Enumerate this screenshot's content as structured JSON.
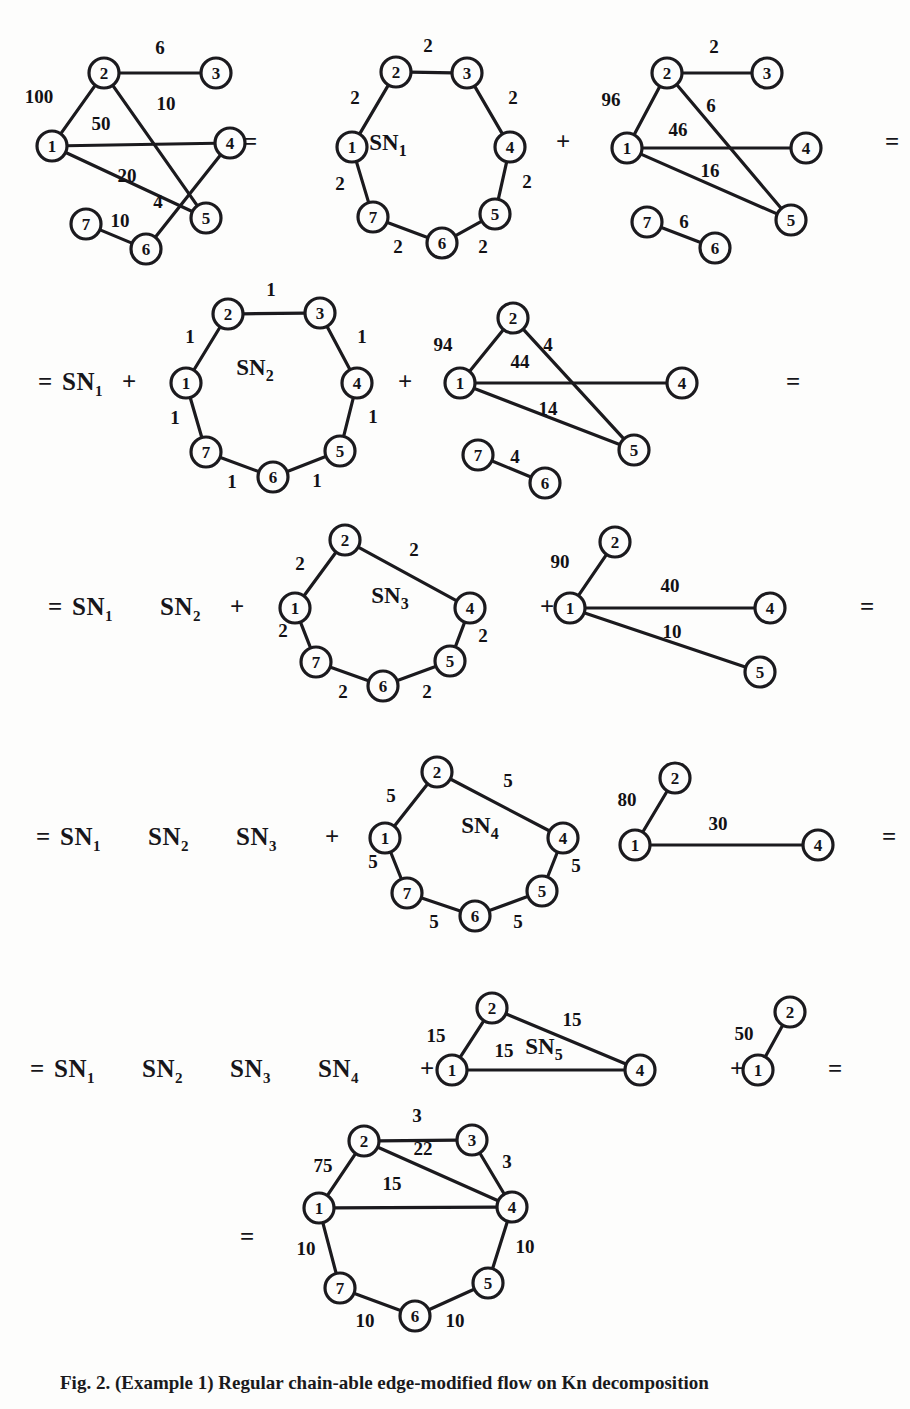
{
  "figure": {
    "caption": "Fig. 2. (Example 1) Regular chain-able edge-modified flow on Kn decomposition",
    "node_radius": 15,
    "colors": {
      "ink": "#17161a",
      "paper": "#fdfdfc",
      "edge": "#1b1a1e"
    }
  },
  "operators": [
    {
      "name": "eq-row1-a",
      "text": "=",
      "x": 243,
      "y": 143
    },
    {
      "name": "plus-row1-a",
      "text": "+",
      "x": 556,
      "y": 143
    },
    {
      "name": "eq-row1-b",
      "text": "=",
      "x": 885,
      "y": 143
    },
    {
      "name": "eq-row2",
      "text": "=",
      "x": 38,
      "y": 383
    },
    {
      "name": "sn1-row2",
      "text": "SN",
      "x": 62,
      "y": 383,
      "sub": "1"
    },
    {
      "name": "plus-row2-a",
      "text": "+",
      "x": 122,
      "y": 383
    },
    {
      "name": "plus-row2-b",
      "text": "+",
      "x": 398,
      "y": 383
    },
    {
      "name": "eq-row2-b",
      "text": "=",
      "x": 786,
      "y": 383
    },
    {
      "name": "eq-row3",
      "text": "=",
      "x": 48,
      "y": 608
    },
    {
      "name": "plus-row3-a",
      "text": "+",
      "x": 230,
      "y": 608
    },
    {
      "name": "plus-row3-b",
      "text": "+",
      "x": 540,
      "y": 608
    },
    {
      "name": "eq-row3-b",
      "text": "=",
      "x": 860,
      "y": 608
    },
    {
      "name": "eq-row4",
      "text": "=",
      "x": 36,
      "y": 838
    },
    {
      "name": "plus-row4-a",
      "text": "+",
      "x": 325,
      "y": 838
    },
    {
      "name": "eq-row4-b",
      "text": "=",
      "x": 882,
      "y": 838
    },
    {
      "name": "eq-row5",
      "text": "=",
      "x": 30,
      "y": 1070
    },
    {
      "name": "plus-row5-a",
      "text": "+",
      "x": 420,
      "y": 1070
    },
    {
      "name": "plus-row5-b",
      "text": "+",
      "x": 730,
      "y": 1070
    },
    {
      "name": "eq-row5-b",
      "text": "=",
      "x": 828,
      "y": 1070
    },
    {
      "name": "eq-row6",
      "text": "=",
      "x": 240,
      "y": 1238
    }
  ],
  "equation_terms": [
    {
      "name": "term-row2-sn1",
      "label": "SN",
      "sub": "1",
      "x": 62,
      "y": 383
    },
    {
      "name": "term-row3-sn1",
      "label": "SN",
      "sub": "1",
      "x": 72,
      "y": 608
    },
    {
      "name": "term-row3-sn2",
      "label": "SN",
      "sub": "2",
      "x": 160,
      "y": 608
    },
    {
      "name": "term-row4-sn1",
      "label": "SN",
      "sub": "1",
      "x": 60,
      "y": 838
    },
    {
      "name": "term-row4-sn2",
      "label": "SN",
      "sub": "2",
      "x": 148,
      "y": 838
    },
    {
      "name": "term-row4-sn3",
      "label": "SN",
      "sub": "3",
      "x": 236,
      "y": 838
    },
    {
      "name": "term-row5-sn1",
      "label": "SN",
      "sub": "1",
      "x": 54,
      "y": 1070
    },
    {
      "name": "term-row5-sn2",
      "label": "SN",
      "sub": "2",
      "x": 142,
      "y": 1070
    },
    {
      "name": "term-row5-sn3",
      "label": "SN",
      "sub": "3",
      "x": 230,
      "y": 1070
    },
    {
      "name": "term-row5-sn4",
      "label": "SN",
      "sub": "4",
      "x": 318,
      "y": 1070
    }
  ],
  "graphs": [
    {
      "id": "g-original",
      "name": "original-weighted-graph",
      "center_label": null,
      "nodes": [
        {
          "id": "2",
          "x": 104,
          "y": 73
        },
        {
          "id": "3",
          "x": 216,
          "y": 73
        },
        {
          "id": "1",
          "x": 52,
          "y": 146
        },
        {
          "id": "4",
          "x": 230,
          "y": 143
        },
        {
          "id": "7",
          "x": 86,
          "y": 224
        },
        {
          "id": "6",
          "x": 146,
          "y": 249
        },
        {
          "id": "5",
          "x": 206,
          "y": 218
        }
      ],
      "edges": [
        {
          "from": "2",
          "to": "3",
          "weight": "6",
          "lx": 160,
          "ly": 54
        },
        {
          "from": "1",
          "to": "2",
          "weight": "100",
          "lx": 39,
          "ly": 103
        },
        {
          "from": "2",
          "to": "5",
          "weight": "10",
          "lx": 166,
          "ly": 110
        },
        {
          "from": "1",
          "to": "4",
          "weight": "50",
          "lx": 101,
          "ly": 130
        },
        {
          "from": "1",
          "to": "5",
          "weight": "20",
          "lx": 127,
          "ly": 182
        },
        {
          "from": "4",
          "to": "6",
          "weight": "4",
          "lx": 158,
          "ly": 208
        },
        {
          "from": "7",
          "to": "6",
          "weight": "10",
          "lx": 120,
          "ly": 227
        }
      ]
    },
    {
      "id": "g-sn1",
      "name": "sn1-cycle-graph",
      "center_label": "SN",
      "center_sub": "1",
      "cx": 388,
      "cy": 150,
      "nodes": [
        {
          "id": "2",
          "x": 396,
          "y": 72
        },
        {
          "id": "3",
          "x": 467,
          "y": 73
        },
        {
          "id": "1",
          "x": 352,
          "y": 147
        },
        {
          "id": "4",
          "x": 510,
          "y": 147
        },
        {
          "id": "7",
          "x": 373,
          "y": 217
        },
        {
          "id": "6",
          "x": 442,
          "y": 243
        },
        {
          "id": "5",
          "x": 495,
          "y": 214
        }
      ],
      "edges": [
        {
          "from": "2",
          "to": "3",
          "weight": "2",
          "lx": 428,
          "ly": 52
        },
        {
          "from": "1",
          "to": "2",
          "weight": "2",
          "lx": 355,
          "ly": 104
        },
        {
          "from": "3",
          "to": "4",
          "weight": "2",
          "lx": 513,
          "ly": 104
        },
        {
          "from": "1",
          "to": "7",
          "weight": "2",
          "lx": 340,
          "ly": 190
        },
        {
          "from": "4",
          "to": "5",
          "weight": "2",
          "lx": 527,
          "ly": 188
        },
        {
          "from": "7",
          "to": "6",
          "weight": "2",
          "lx": 398,
          "ly": 253
        },
        {
          "from": "6",
          "to": "5",
          "weight": "2",
          "lx": 483,
          "ly": 253
        }
      ]
    },
    {
      "id": "g-res1",
      "name": "residual-graph-1",
      "center_label": null,
      "nodes": [
        {
          "id": "2",
          "x": 667,
          "y": 73
        },
        {
          "id": "3",
          "x": 767,
          "y": 73
        },
        {
          "id": "1",
          "x": 627,
          "y": 148
        },
        {
          "id": "4",
          "x": 806,
          "y": 148
        },
        {
          "id": "7",
          "x": 647,
          "y": 222
        },
        {
          "id": "6",
          "x": 715,
          "y": 248
        },
        {
          "id": "5",
          "x": 791,
          "y": 220
        }
      ],
      "edges": [
        {
          "from": "2",
          "to": "3",
          "weight": "2",
          "lx": 714,
          "ly": 53
        },
        {
          "from": "1",
          "to": "2",
          "weight": "96",
          "lx": 611,
          "ly": 106
        },
        {
          "from": "2",
          "to": "5",
          "weight": "6",
          "lx": 711,
          "ly": 112
        },
        {
          "from": "1",
          "to": "4",
          "weight": "46",
          "lx": 678,
          "ly": 136
        },
        {
          "from": "1",
          "to": "5",
          "weight": "16",
          "lx": 710,
          "ly": 177
        },
        {
          "from": "7",
          "to": "6",
          "weight": "6",
          "lx": 684,
          "ly": 228
        }
      ]
    },
    {
      "id": "g-sn2",
      "name": "sn2-cycle-graph",
      "center_label": "SN",
      "center_sub": "2",
      "cx": 255,
      "cy": 375,
      "nodes": [
        {
          "id": "2",
          "x": 228,
          "y": 314
        },
        {
          "id": "3",
          "x": 320,
          "y": 313
        },
        {
          "id": "1",
          "x": 186,
          "y": 383
        },
        {
          "id": "4",
          "x": 357,
          "y": 383
        },
        {
          "id": "7",
          "x": 206,
          "y": 452
        },
        {
          "id": "6",
          "x": 273,
          "y": 477
        },
        {
          "id": "5",
          "x": 340,
          "y": 451
        }
      ],
      "edges": [
        {
          "from": "2",
          "to": "3",
          "weight": "1",
          "lx": 271,
          "ly": 296
        },
        {
          "from": "1",
          "to": "2",
          "weight": "1",
          "lx": 190,
          "ly": 343
        },
        {
          "from": "3",
          "to": "4",
          "weight": "1",
          "lx": 362,
          "ly": 343
        },
        {
          "from": "1",
          "to": "7",
          "weight": "1",
          "lx": 175,
          "ly": 424
        },
        {
          "from": "4",
          "to": "5",
          "weight": "1",
          "lx": 373,
          "ly": 423
        },
        {
          "from": "7",
          "to": "6",
          "weight": "1",
          "lx": 232,
          "ly": 488
        },
        {
          "from": "6",
          "to": "5",
          "weight": "1",
          "lx": 317,
          "ly": 487
        }
      ]
    },
    {
      "id": "g-res2",
      "name": "residual-graph-2",
      "center_label": null,
      "nodes": [
        {
          "id": "2",
          "x": 513,
          "y": 318
        },
        {
          "id": "1",
          "x": 460,
          "y": 383
        },
        {
          "id": "4",
          "x": 682,
          "y": 383
        },
        {
          "id": "7",
          "x": 478,
          "y": 455
        },
        {
          "id": "6",
          "x": 545,
          "y": 483
        },
        {
          "id": "5",
          "x": 634,
          "y": 450
        }
      ],
      "edges": [
        {
          "from": "1",
          "to": "2",
          "weight": "94",
          "lx": 443,
          "ly": 351
        },
        {
          "from": "2",
          "to": "5",
          "weight": "4",
          "lx": 548,
          "ly": 351
        },
        {
          "from": "1",
          "to": "4",
          "weight": "44",
          "lx": 520,
          "ly": 368
        },
        {
          "from": "1",
          "to": "5",
          "weight": "14",
          "lx": 548,
          "ly": 415
        },
        {
          "from": "7",
          "to": "6",
          "weight": "4",
          "lx": 515,
          "ly": 463
        }
      ]
    },
    {
      "id": "g-sn3",
      "name": "sn3-cycle-graph",
      "center_label": "SN",
      "center_sub": "3",
      "cx": 390,
      "cy": 603,
      "nodes": [
        {
          "id": "2",
          "x": 345,
          "y": 540
        },
        {
          "id": "1",
          "x": 295,
          "y": 608
        },
        {
          "id": "4",
          "x": 470,
          "y": 608
        },
        {
          "id": "7",
          "x": 316,
          "y": 662
        },
        {
          "id": "6",
          "x": 383,
          "y": 686
        },
        {
          "id": "5",
          "x": 450,
          "y": 661
        }
      ],
      "edges": [
        {
          "from": "1",
          "to": "2",
          "weight": "2",
          "lx": 300,
          "ly": 570
        },
        {
          "from": "2",
          "to": "4",
          "weight": "2",
          "lx": 414,
          "ly": 556
        },
        {
          "from": "1",
          "to": "7",
          "weight": "2",
          "lx": 283,
          "ly": 637
        },
        {
          "from": "4",
          "to": "5",
          "weight": "2",
          "lx": 483,
          "ly": 642
        },
        {
          "from": "7",
          "to": "6",
          "weight": "2",
          "lx": 343,
          "ly": 698
        },
        {
          "from": "6",
          "to": "5",
          "weight": "2",
          "lx": 427,
          "ly": 698
        }
      ]
    },
    {
      "id": "g-res3",
      "name": "residual-graph-3",
      "center_label": null,
      "nodes": [
        {
          "id": "2",
          "x": 615,
          "y": 542
        },
        {
          "id": "1",
          "x": 570,
          "y": 608
        },
        {
          "id": "4",
          "x": 770,
          "y": 608
        },
        {
          "id": "5",
          "x": 760,
          "y": 672
        }
      ],
      "edges": [
        {
          "from": "1",
          "to": "2",
          "weight": "90",
          "lx": 560,
          "ly": 568
        },
        {
          "from": "1",
          "to": "4",
          "weight": "40",
          "lx": 670,
          "ly": 592
        },
        {
          "from": "1",
          "to": "5",
          "weight": "10",
          "lx": 672,
          "ly": 638
        }
      ]
    },
    {
      "id": "g-sn4",
      "name": "sn4-cycle-graph",
      "center_label": "SN",
      "center_sub": "4",
      "cx": 480,
      "cy": 833,
      "nodes": [
        {
          "id": "2",
          "x": 437,
          "y": 772
        },
        {
          "id": "1",
          "x": 385,
          "y": 838
        },
        {
          "id": "4",
          "x": 563,
          "y": 838
        },
        {
          "id": "7",
          "x": 407,
          "y": 893
        },
        {
          "id": "6",
          "x": 475,
          "y": 916
        },
        {
          "id": "5",
          "x": 542,
          "y": 891
        }
      ],
      "edges": [
        {
          "from": "1",
          "to": "2",
          "weight": "5",
          "lx": 391,
          "ly": 802
        },
        {
          "from": "2",
          "to": "4",
          "weight": "5",
          "lx": 508,
          "ly": 787
        },
        {
          "from": "1",
          "to": "7",
          "weight": "5",
          "lx": 373,
          "ly": 868
        },
        {
          "from": "4",
          "to": "5",
          "weight": "5",
          "lx": 576,
          "ly": 872
        },
        {
          "from": "7",
          "to": "6",
          "weight": "5",
          "lx": 434,
          "ly": 928
        },
        {
          "from": "6",
          "to": "5",
          "weight": "5",
          "lx": 518,
          "ly": 928
        }
      ]
    },
    {
      "id": "g-res4",
      "name": "residual-graph-4",
      "center_label": null,
      "nodes": [
        {
          "id": "2",
          "x": 675,
          "y": 778
        },
        {
          "id": "1",
          "x": 635,
          "y": 845
        },
        {
          "id": "4",
          "x": 818,
          "y": 845
        }
      ],
      "edges": [
        {
          "from": "1",
          "to": "2",
          "weight": "80",
          "lx": 627,
          "ly": 806
        },
        {
          "from": "1",
          "to": "4",
          "weight": "30",
          "lx": 718,
          "ly": 830
        }
      ]
    },
    {
      "id": "g-sn5",
      "name": "sn5-triangle-graph",
      "center_label": "SN",
      "center_sub": "5",
      "cx": 544,
      "cy": 1054,
      "nodes": [
        {
          "id": "2",
          "x": 492,
          "y": 1008
        },
        {
          "id": "1",
          "x": 452,
          "y": 1070
        },
        {
          "id": "4",
          "x": 640,
          "y": 1070
        }
      ],
      "edges": [
        {
          "from": "1",
          "to": "2",
          "weight": "15",
          "lx": 436,
          "ly": 1042
        },
        {
          "from": "2",
          "to": "4",
          "weight": "15",
          "lx": 572,
          "ly": 1026
        },
        {
          "from": "1",
          "to": "4",
          "weight": "15",
          "lx": 504,
          "ly": 1057
        }
      ]
    },
    {
      "id": "g-res5",
      "name": "residual-graph-5",
      "center_label": null,
      "nodes": [
        {
          "id": "2",
          "x": 790,
          "y": 1012
        },
        {
          "id": "1",
          "x": 758,
          "y": 1070
        }
      ],
      "edges": [
        {
          "from": "1",
          "to": "2",
          "weight": "50",
          "lx": 744,
          "ly": 1040
        }
      ]
    },
    {
      "id": "g-final",
      "name": "final-result-graph",
      "center_label": null,
      "nodes": [
        {
          "id": "2",
          "x": 364,
          "y": 1141
        },
        {
          "id": "3",
          "x": 472,
          "y": 1140
        },
        {
          "id": "1",
          "x": 319,
          "y": 1208
        },
        {
          "id": "4",
          "x": 512,
          "y": 1207
        },
        {
          "id": "7",
          "x": 340,
          "y": 1288
        },
        {
          "id": "6",
          "x": 415,
          "y": 1316
        },
        {
          "id": "5",
          "x": 488,
          "y": 1283
        }
      ],
      "edges": [
        {
          "from": "2",
          "to": "3",
          "weight": "3",
          "lx": 417,
          "ly": 1122
        },
        {
          "from": "1",
          "to": "2",
          "weight": "75",
          "lx": 323,
          "ly": 1172
        },
        {
          "from": "2",
          "to": "4",
          "weight": "22",
          "lx": 423,
          "ly": 1155
        },
        {
          "from": "3",
          "to": "4",
          "weight": "3",
          "lx": 507,
          "ly": 1168
        },
        {
          "from": "1",
          "to": "4",
          "weight": "15",
          "lx": 392,
          "ly": 1190
        },
        {
          "from": "1",
          "to": "7",
          "weight": "10",
          "lx": 306,
          "ly": 1255
        },
        {
          "from": "4",
          "to": "5",
          "weight": "10",
          "lx": 525,
          "ly": 1253
        },
        {
          "from": "7",
          "to": "6",
          "weight": "10",
          "lx": 365,
          "ly": 1327
        },
        {
          "from": "6",
          "to": "5",
          "weight": "10",
          "lx": 455,
          "ly": 1327
        }
      ]
    }
  ]
}
